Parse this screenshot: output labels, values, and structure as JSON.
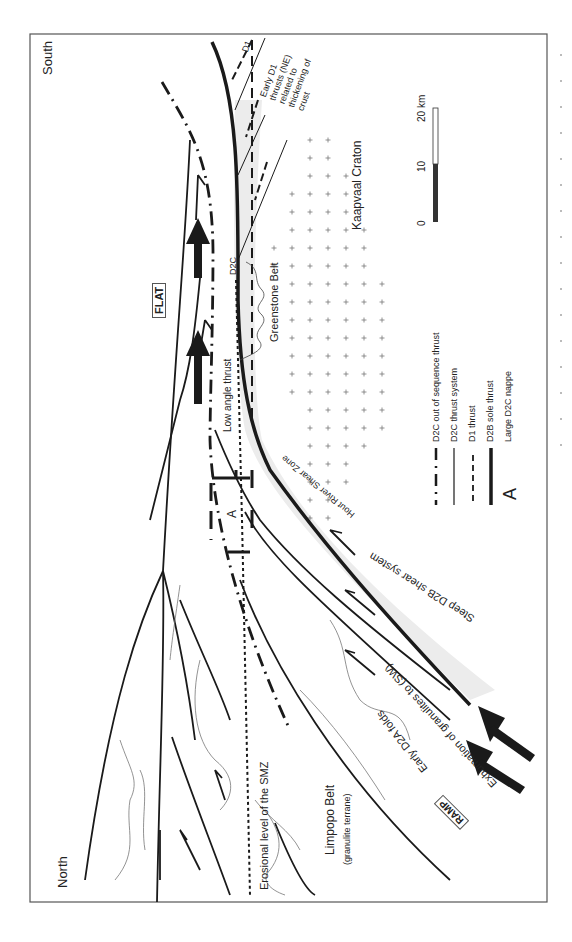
{
  "diagram": {
    "orientation": "rotated 90 degrees clockwise",
    "labels": {
      "south": "South",
      "north": "North",
      "kaapvaal_craton": "Kaapvaal Craton",
      "greenstone_belt": "Greenstone Belt",
      "flat": "FLAT",
      "ramp": "RAMP",
      "low_angle_thrust": "Low angle thrust",
      "hout_river": "Hout River Shear Zone",
      "steep_d2b": "Steep D2B shear system",
      "exhumation": "Exhumation of granulites to (SW)",
      "early_d2a": "Early D2A folds",
      "limpopo_belt": "Limpopo Belt",
      "granulite_terrane": "(granulite terrane)",
      "erosional_level": "Erosional level of the SMZ",
      "d2c_marker": "D2C",
      "d1_marker": "D1",
      "early_d1": [
        "Early D1",
        "thrusts (NE)",
        "related to",
        "thickening of",
        "crust"
      ],
      "nappe_a": "A"
    },
    "scale_bar": {
      "ticks": [
        "0",
        "10",
        "20 km"
      ],
      "colors": {
        "filled": "#333333",
        "empty": "#ffffff"
      }
    },
    "legend": [
      {
        "symbol": "dash-dot",
        "label": "D2C out of sequence thrust"
      },
      {
        "symbol": "thin-line",
        "label": "D2C thrust system"
      },
      {
        "symbol": "dashed-arrow",
        "label": "D1 thrust"
      },
      {
        "symbol": "thick-line",
        "label": "D2B sole thrust"
      },
      {
        "symbol": "letter-A",
        "label": "Large D2C nappe"
      }
    ],
    "colors": {
      "line": "#1a1a1a",
      "shear_zone_fill": "#ececec",
      "frame": "#555555"
    }
  }
}
